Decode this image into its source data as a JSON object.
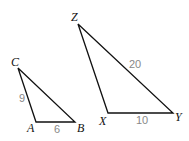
{
  "triangles": [
    {
      "name": "ABC",
      "vertices": {
        "A": "A",
        "B": "B",
        "C": "C"
      },
      "sides": {
        "CA": "9",
        "AB": "6"
      }
    },
    {
      "name": "XYZ",
      "vertices": {
        "X": "X",
        "Y": "Y",
        "Z": "Z"
      },
      "sides": {
        "ZY": "20",
        "XY": "10"
      }
    }
  ]
}
